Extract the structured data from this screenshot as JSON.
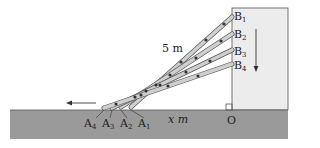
{
  "diagram": {
    "colors": {
      "ground": "#9a9a9a",
      "wall": "#ececec",
      "ladder": "#cfcfcf",
      "ladder_outline": "#6a6a6a",
      "rung": "#333333",
      "text": "#222222"
    },
    "labels": {
      "length": "5 m",
      "distance": "x m",
      "origin": "O",
      "top_points": [
        {
          "letter": "B",
          "sub": "1"
        },
        {
          "letter": "B",
          "sub": "2"
        },
        {
          "letter": "B",
          "sub": "3"
        },
        {
          "letter": "B",
          "sub": "4"
        }
      ],
      "bottom_points": [
        {
          "letter": "A",
          "sub": "4"
        },
        {
          "letter": "A",
          "sub": "3"
        },
        {
          "letter": "A",
          "sub": "2"
        },
        {
          "letter": "A",
          "sub": "1"
        }
      ]
    },
    "arrows": {
      "ground_motion": "left",
      "wall_motion": "down"
    },
    "ladders": [
      {
        "top": "B1",
        "bottom": "A1"
      },
      {
        "top": "B2",
        "bottom": "A2"
      },
      {
        "top": "B3",
        "bottom": "A3"
      },
      {
        "top": "B4",
        "bottom": "A4"
      }
    ]
  }
}
